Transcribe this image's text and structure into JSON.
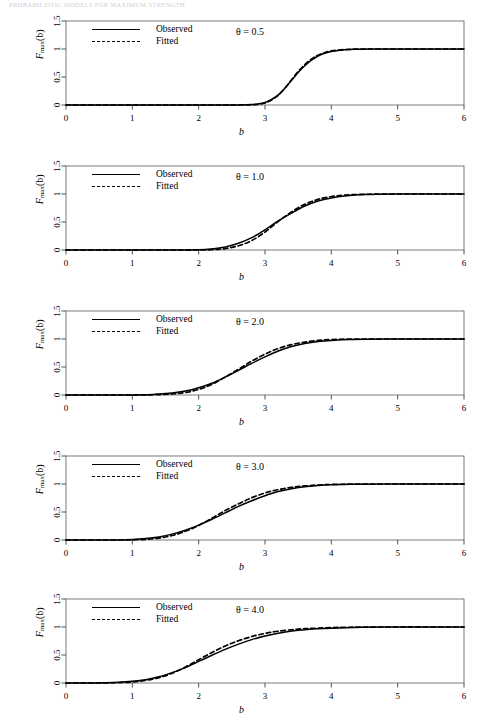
{
  "running_head": "PROBABILISTIC MODELS FOR MAXIMUM STRENGTH",
  "figure": {
    "xlabel": "b",
    "ylabel_main": "F",
    "ylabel_sub": "max",
    "ylabel_arg": "(b)",
    "legend": [
      {
        "label": "Observed",
        "style": "solid"
      },
      {
        "label": "Fitted",
        "style": "dashed"
      }
    ]
  },
  "chart_data": [
    {
      "type": "line",
      "title": "",
      "annotation": "θ = 0.5",
      "theta": 0.5,
      "xlabel": "b",
      "ylabel": "F_max(b)",
      "xlim": [
        0,
        6
      ],
      "ylim": [
        0,
        1.5
      ],
      "xticks": [
        0,
        1,
        2,
        3,
        4,
        5,
        6
      ],
      "xtick_labels": [
        "0",
        "1",
        "2",
        "3",
        "4",
        "5",
        "6"
      ],
      "yticks": [
        0,
        0.5,
        1,
        1.5
      ],
      "ytick_labels": [
        "0",
        "0.5",
        "1",
        "1.5"
      ],
      "grid": false,
      "legend_position": "upper-left",
      "series": [
        {
          "name": "Observed",
          "style": "solid",
          "color": "#000000",
          "x": [
            0.0,
            0.5,
            1.0,
            1.5,
            2.0,
            2.4,
            2.6,
            2.8,
            2.9,
            3.0,
            3.1,
            3.2,
            3.3,
            3.4,
            3.5,
            3.6,
            3.7,
            3.8,
            3.9,
            4.0,
            4.2,
            4.4,
            4.6,
            5.0,
            5.5,
            6.0
          ],
          "y": [
            0.0,
            0.0,
            0.0,
            0.0,
            0.0,
            0.0,
            0.002,
            0.01,
            0.02,
            0.045,
            0.1,
            0.18,
            0.3,
            0.44,
            0.58,
            0.7,
            0.8,
            0.875,
            0.925,
            0.955,
            0.985,
            0.995,
            0.999,
            1.0,
            1.0,
            1.0
          ]
        },
        {
          "name": "Fitted",
          "style": "dashed",
          "color": "#000000",
          "x": [
            0.0,
            0.5,
            1.0,
            1.5,
            2.0,
            2.4,
            2.6,
            2.8,
            2.9,
            3.0,
            3.1,
            3.2,
            3.3,
            3.4,
            3.5,
            3.6,
            3.7,
            3.8,
            3.9,
            4.0,
            4.2,
            4.4,
            4.6,
            5.0,
            5.5,
            6.0
          ],
          "y": [
            0.0,
            0.0,
            0.0,
            0.0,
            0.0,
            0.0,
            0.0,
            0.004,
            0.012,
            0.035,
            0.09,
            0.175,
            0.3,
            0.45,
            0.6,
            0.72,
            0.82,
            0.89,
            0.935,
            0.965,
            0.99,
            0.998,
            1.0,
            1.0,
            1.0,
            1.0
          ]
        }
      ]
    },
    {
      "type": "line",
      "title": "",
      "annotation": "θ = 1.0",
      "theta": 1.0,
      "xlabel": "b",
      "ylabel": "F_max(b)",
      "xlim": [
        0,
        6
      ],
      "ylim": [
        0,
        1.5
      ],
      "xticks": [
        0,
        1,
        2,
        3,
        4,
        5,
        6
      ],
      "xtick_labels": [
        "0",
        "1",
        "2",
        "3",
        "4",
        "5",
        "6"
      ],
      "yticks": [
        0,
        0.5,
        1,
        1.5
      ],
      "ytick_labels": [
        "0",
        "0.5",
        "1",
        "1.5"
      ],
      "grid": false,
      "legend_position": "upper-left",
      "series": [
        {
          "name": "Observed",
          "style": "solid",
          "color": "#000000",
          "x": [
            0.0,
            0.5,
            1.0,
            1.5,
            2.0,
            2.2,
            2.4,
            2.6,
            2.8,
            3.0,
            3.2,
            3.4,
            3.6,
            3.8,
            4.0,
            4.2,
            4.5,
            5.0,
            5.5,
            6.0
          ],
          "y": [
            0.0,
            0.0,
            0.0,
            0.0,
            0.005,
            0.02,
            0.055,
            0.12,
            0.22,
            0.36,
            0.52,
            0.66,
            0.785,
            0.875,
            0.93,
            0.965,
            0.99,
            1.0,
            1.0,
            1.0
          ]
        },
        {
          "name": "Fitted",
          "style": "dashed",
          "color": "#000000",
          "x": [
            0.0,
            0.5,
            1.0,
            1.5,
            2.0,
            2.2,
            2.4,
            2.6,
            2.8,
            3.0,
            3.2,
            3.4,
            3.6,
            3.8,
            4.0,
            4.2,
            4.5,
            5.0,
            5.5,
            6.0
          ],
          "y": [
            0.0,
            0.0,
            0.0,
            0.0,
            0.0,
            0.006,
            0.025,
            0.075,
            0.17,
            0.32,
            0.51,
            0.68,
            0.815,
            0.905,
            0.955,
            0.98,
            0.995,
            1.0,
            1.0,
            1.0
          ]
        }
      ]
    },
    {
      "type": "line",
      "title": "",
      "annotation": "θ = 2.0",
      "theta": 2.0,
      "xlabel": "b",
      "ylabel": "F_max(b)",
      "xlim": [
        0,
        6
      ],
      "ylim": [
        0,
        1.5
      ],
      "xticks": [
        0,
        1,
        2,
        3,
        4,
        5,
        6
      ],
      "xtick_labels": [
        "0",
        "1",
        "2",
        "3",
        "4",
        "5",
        "6"
      ],
      "yticks": [
        0,
        0.5,
        1,
        1.5
      ],
      "ytick_labels": [
        "0",
        "0.5",
        "1",
        "1.5"
      ],
      "grid": false,
      "legend_position": "upper-left",
      "series": [
        {
          "name": "Observed",
          "style": "solid",
          "color": "#000000",
          "x": [
            0.0,
            0.5,
            1.0,
            1.3,
            1.6,
            1.8,
            2.0,
            2.2,
            2.4,
            2.6,
            2.8,
            3.0,
            3.2,
            3.4,
            3.6,
            3.8,
            4.0,
            4.3,
            4.8,
            5.4,
            6.0
          ],
          "y": [
            0.0,
            0.0,
            0.002,
            0.01,
            0.035,
            0.07,
            0.13,
            0.21,
            0.32,
            0.44,
            0.565,
            0.68,
            0.785,
            0.865,
            0.92,
            0.955,
            0.975,
            0.99,
            1.0,
            1.0,
            1.0
          ]
        },
        {
          "name": "Fitted",
          "style": "dashed",
          "color": "#000000",
          "x": [
            0.0,
            0.5,
            1.0,
            1.3,
            1.6,
            1.8,
            2.0,
            2.2,
            2.4,
            2.6,
            2.8,
            3.0,
            3.2,
            3.4,
            3.6,
            3.8,
            4.0,
            4.3,
            4.8,
            5.4,
            6.0
          ],
          "y": [
            0.0,
            0.0,
            0.0,
            0.004,
            0.018,
            0.045,
            0.1,
            0.19,
            0.32,
            0.46,
            0.605,
            0.73,
            0.83,
            0.9,
            0.945,
            0.975,
            0.99,
            0.998,
            1.0,
            1.0,
            1.0
          ]
        }
      ]
    },
    {
      "type": "line",
      "title": "",
      "annotation": "θ = 3.0",
      "theta": 3.0,
      "xlabel": "b",
      "ylabel": "F_max(b)",
      "xlim": [
        0,
        6
      ],
      "ylim": [
        0,
        1.5
      ],
      "xticks": [
        0,
        1,
        2,
        3,
        4,
        5,
        6
      ],
      "xtick_labels": [
        "0",
        "1",
        "2",
        "3",
        "4",
        "5",
        "6"
      ],
      "yticks": [
        0,
        0.5,
        1,
        1.5
      ],
      "ytick_labels": [
        "0",
        "0.5",
        "1",
        "1.5"
      ],
      "grid": false,
      "legend_position": "upper-left",
      "series": [
        {
          "name": "Observed",
          "style": "solid",
          "color": "#000000",
          "x": [
            0.0,
            0.4,
            0.8,
            1.0,
            1.2,
            1.4,
            1.6,
            1.8,
            2.0,
            2.2,
            2.4,
            2.6,
            2.8,
            3.0,
            3.2,
            3.4,
            3.6,
            3.9,
            4.3,
            4.9,
            6.0
          ],
          "y": [
            0.0,
            0.0,
            0.002,
            0.008,
            0.025,
            0.055,
            0.105,
            0.175,
            0.265,
            0.37,
            0.485,
            0.6,
            0.7,
            0.79,
            0.865,
            0.915,
            0.95,
            0.98,
            0.995,
            1.0,
            1.0
          ]
        },
        {
          "name": "Fitted",
          "style": "dashed",
          "color": "#000000",
          "x": [
            0.0,
            0.4,
            0.8,
            1.0,
            1.2,
            1.4,
            1.6,
            1.8,
            2.0,
            2.2,
            2.4,
            2.6,
            2.8,
            3.0,
            3.2,
            3.4,
            3.6,
            3.9,
            4.3,
            4.9,
            6.0
          ],
          "y": [
            0.0,
            0.0,
            0.0,
            0.002,
            0.012,
            0.035,
            0.08,
            0.155,
            0.26,
            0.39,
            0.525,
            0.645,
            0.755,
            0.84,
            0.9,
            0.94,
            0.965,
            0.988,
            0.998,
            1.0,
            1.0
          ]
        }
      ]
    },
    {
      "type": "line",
      "title": "",
      "annotation": "θ = 4.0",
      "theta": 4.0,
      "xlabel": "b",
      "ylabel": "F_max(b)",
      "xlim": [
        0,
        6
      ],
      "ylim": [
        0,
        1.5
      ],
      "xticks": [
        0,
        1,
        2,
        3,
        4,
        5,
        6
      ],
      "xtick_labels": [
        "0",
        "1",
        "2",
        "3",
        "4",
        "5",
        "6"
      ],
      "yticks": [
        0,
        0.5,
        1,
        1.5
      ],
      "ytick_labels": [
        "0",
        "0.5",
        "1",
        "1.5"
      ],
      "grid": false,
      "legend_position": "upper-left",
      "series": [
        {
          "name": "Observed",
          "style": "solid",
          "color": "#000000",
          "x": [
            0.0,
            0.3,
            0.6,
            0.8,
            1.0,
            1.2,
            1.4,
            1.6,
            1.8,
            2.0,
            2.2,
            2.4,
            2.6,
            2.8,
            3.0,
            3.2,
            3.5,
            3.8,
            4.2,
            4.8,
            6.0
          ],
          "y": [
            0.0,
            0.0,
            0.004,
            0.012,
            0.03,
            0.06,
            0.11,
            0.185,
            0.275,
            0.385,
            0.495,
            0.6,
            0.695,
            0.775,
            0.84,
            0.89,
            0.94,
            0.968,
            0.988,
            0.998,
            1.0
          ]
        },
        {
          "name": "Fitted",
          "style": "dashed",
          "color": "#000000",
          "x": [
            0.0,
            0.3,
            0.6,
            0.8,
            1.0,
            1.2,
            1.4,
            1.6,
            1.8,
            2.0,
            2.2,
            2.4,
            2.6,
            2.8,
            3.0,
            3.2,
            3.5,
            3.8,
            4.2,
            4.8,
            6.0
          ],
          "y": [
            0.0,
            0.0,
            0.002,
            0.006,
            0.018,
            0.045,
            0.095,
            0.175,
            0.285,
            0.415,
            0.545,
            0.66,
            0.755,
            0.83,
            0.885,
            0.925,
            0.962,
            0.98,
            0.994,
            1.0,
            1.0
          ]
        }
      ]
    }
  ]
}
